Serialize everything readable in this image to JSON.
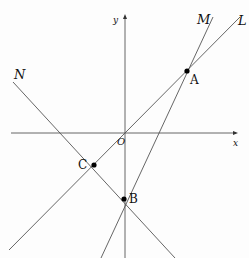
{
  "diagram": {
    "type": "coordinate-geometry",
    "axes": {
      "x_label": "x",
      "y_label": "y",
      "origin_label": "O"
    },
    "lines": [
      {
        "id": "L",
        "label": "L",
        "through": [
          "O",
          "A"
        ]
      },
      {
        "id": "M",
        "label": "M",
        "through": [
          "B",
          "A"
        ]
      },
      {
        "id": "N",
        "label": "N",
        "through": [
          "C",
          "B"
        ]
      }
    ],
    "points": [
      {
        "id": "A",
        "label": "A"
      },
      {
        "id": "B",
        "label": "B"
      },
      {
        "id": "C",
        "label": "C"
      }
    ],
    "colors": {
      "line": "#555555",
      "point": "#000000",
      "text": "#111111"
    }
  }
}
